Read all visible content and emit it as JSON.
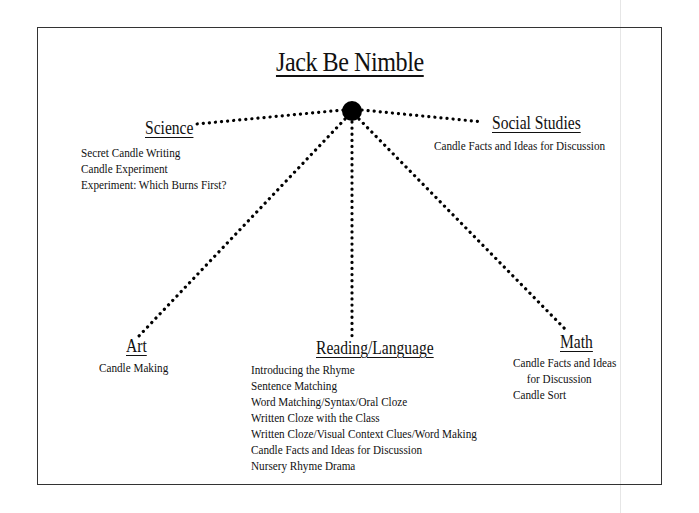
{
  "diagram": {
    "title": "Jack Be Nimble",
    "hub": {
      "shape": "filled-circle",
      "color": "#000000"
    },
    "branches": {
      "science": {
        "heading": "Science",
        "items": [
          "Secret Candle Writing",
          "Candle Experiment",
          "Experiment: Which Burns First?"
        ]
      },
      "social_studies": {
        "heading": "Social Studies",
        "items": [
          "Candle Facts and Ideas for Discussion"
        ]
      },
      "art": {
        "heading": "Art",
        "items": [
          "Candle Making"
        ]
      },
      "reading_language": {
        "heading": "Reading/Language",
        "items": [
          "Introducing the Rhyme",
          "Sentence Matching",
          "Word Matching/Syntax/Oral Cloze",
          "Written Cloze with the Class",
          "Written Cloze/Visual Context Clues/Word Making",
          "Candle Facts and Ideas for Discussion",
          "Nursery Rhyme Drama"
        ]
      },
      "math": {
        "heading": "Math",
        "items": [
          "Candle Facts and Ideas",
          "for Discussion",
          "Candle Sort"
        ]
      }
    },
    "connector_style": "dotted",
    "line_color": "#000000",
    "frame_color": "#333333"
  }
}
